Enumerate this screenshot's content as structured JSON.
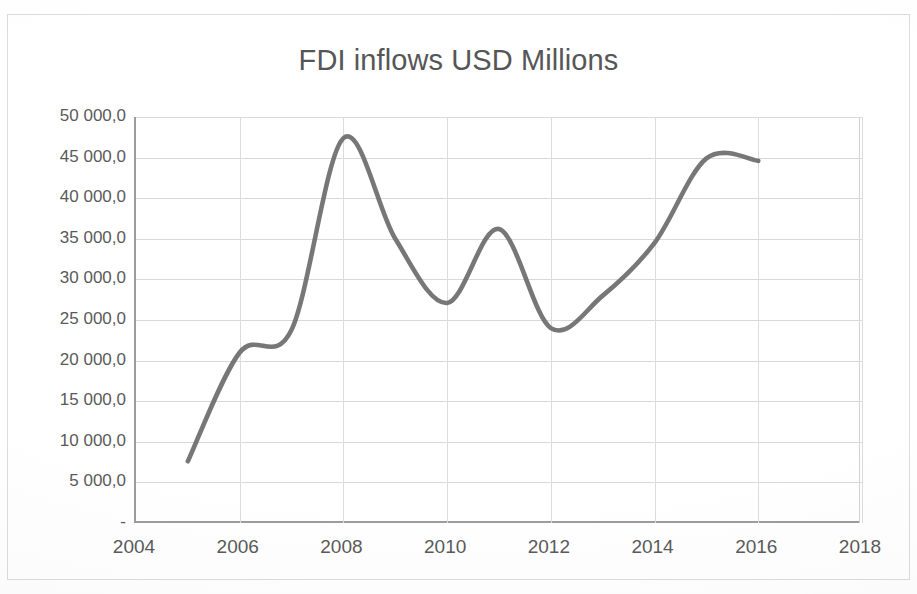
{
  "chart_data": {
    "type": "line",
    "title": "FDI inflows USD Millions",
    "xlabel": "",
    "ylabel": "",
    "xlim": [
      2004,
      2018
    ],
    "ylim": [
      0,
      50000
    ],
    "grid": true,
    "legend": "none",
    "x_tick_labels": [
      "2004",
      "2006",
      "2008",
      "2010",
      "2012",
      "2014",
      "2016",
      "2018"
    ],
    "x_ticks": [
      2004,
      2006,
      2008,
      2010,
      2012,
      2014,
      2016,
      2018
    ],
    "y_tick_labels": [
      "50 000,0",
      "45 000,0",
      "40 000,0",
      "35 000,0",
      "30 000,0",
      "25 000,0",
      "20 000,0",
      "15 000,0",
      "10 000,0",
      "5 000,0",
      "-"
    ],
    "y_ticks": [
      50000,
      45000,
      40000,
      35000,
      30000,
      25000,
      20000,
      15000,
      10000,
      5000,
      0
    ],
    "series": [
      {
        "name": "FDI inflows",
        "color": "#6b6b6b",
        "x": [
          2005,
          2006,
          2007,
          2008,
          2009,
          2010,
          2011,
          2012,
          2013,
          2014,
          2015,
          2016
        ],
        "values": [
          7600,
          21000,
          23800,
          47400,
          35000,
          27100,
          36200,
          24000,
          28000,
          34500,
          44900,
          44600
        ]
      }
    ]
  },
  "axis_label_color": "#5a5a5a",
  "grid_color": "#d9d9d9",
  "axis_line_color": "#9c9c9c"
}
